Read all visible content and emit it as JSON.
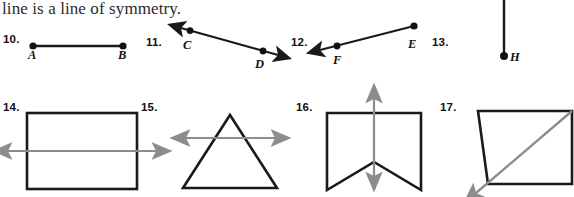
{
  "worksheet": {
    "prompt": "line is a line of symmetry.",
    "items": [
      {
        "number": "10.",
        "figure": "segment-ab",
        "point_labels": [
          "A",
          "B"
        ]
      },
      {
        "number": "11.",
        "figure": "line-cd",
        "point_labels": [
          "C",
          "D"
        ]
      },
      {
        "number": "12.",
        "figure": "ray-ef",
        "point_labels": [
          "E",
          "F"
        ]
      },
      {
        "number": "13.",
        "figure": "segment-gh",
        "point_labels": [
          "G",
          "H"
        ]
      },
      {
        "number": "14.",
        "figure": "rectangle-with-horizontal-line",
        "point_labels": []
      },
      {
        "number": "15.",
        "figure": "triangle-with-horizontal-line",
        "point_labels": []
      },
      {
        "number": "16.",
        "figure": "chevron-with-vertical-line",
        "point_labels": []
      },
      {
        "number": "17.",
        "figure": "trapezoid-with-diagonal-line",
        "point_labels": []
      }
    ],
    "labels": {
      "n10": "10.",
      "n11": "11.",
      "n12": "12.",
      "n13": "13.",
      "n14": "14.",
      "n15": "15.",
      "n16": "16.",
      "n17": "17.",
      "A": "A",
      "B": "B",
      "C": "C",
      "D": "D",
      "E": "E",
      "F": "F",
      "G": "G",
      "H": "H"
    },
    "colors": {
      "figure_stroke": "#1a1a1a",
      "symmetry_line": "#8c8c8c",
      "text": "#111111",
      "background": "#ffffff"
    }
  }
}
